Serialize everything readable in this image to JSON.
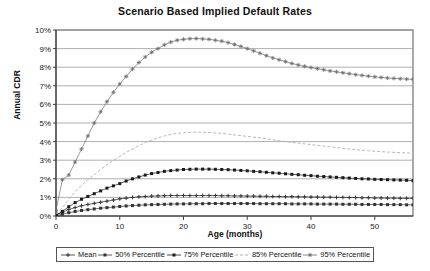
{
  "chart_data": {
    "type": "line",
    "title": "Scenario Based Implied Default Rates",
    "xlabel": "Age (months)",
    "ylabel": "Annual CDR",
    "xlim": [
      0,
      56
    ],
    "ylim": [
      0,
      10
    ],
    "grid": true,
    "legend_position": "bottom",
    "x_ticks": [
      0,
      10,
      20,
      30,
      40,
      50
    ],
    "x_tick_labels": [
      "0",
      "10",
      "20",
      "30",
      "40",
      "50"
    ],
    "y_ticks": [
      0,
      1,
      2,
      3,
      4,
      5,
      6,
      7,
      8,
      9,
      10
    ],
    "y_tick_labels": [
      "0%",
      "1%",
      "2%",
      "3%",
      "4%",
      "5%",
      "6%",
      "7%",
      "8%",
      "9%",
      "10%"
    ],
    "x": [
      0,
      1,
      2,
      3,
      4,
      5,
      6,
      7,
      8,
      9,
      10,
      11,
      12,
      13,
      14,
      15,
      16,
      17,
      18,
      19,
      20,
      21,
      22,
      23,
      24,
      25,
      26,
      27,
      28,
      29,
      30,
      31,
      32,
      33,
      34,
      35,
      36,
      37,
      38,
      39,
      40,
      41,
      42,
      43,
      44,
      45,
      46,
      47,
      48,
      49,
      50,
      51,
      52,
      53,
      54,
      55,
      56
    ],
    "series": [
      {
        "name": "Mean",
        "color": "#2b2b2b",
        "marker": "plus",
        "values": [
          0.05,
          0.2,
          0.35,
          0.45,
          0.55,
          0.62,
          0.68,
          0.74,
          0.8,
          0.86,
          0.92,
          0.96,
          1.0,
          1.03,
          1.05,
          1.07,
          1.08,
          1.09,
          1.1,
          1.1,
          1.1,
          1.1,
          1.1,
          1.1,
          1.1,
          1.1,
          1.09,
          1.09,
          1.08,
          1.08,
          1.07,
          1.07,
          1.06,
          1.06,
          1.05,
          1.05,
          1.04,
          1.04,
          1.03,
          1.03,
          1.02,
          1.02,
          1.01,
          1.01,
          1.0,
          1.0,
          0.99,
          0.99,
          0.98,
          0.98,
          0.97,
          0.97,
          0.96,
          0.96,
          0.95,
          0.95,
          0.95
        ]
      },
      {
        "name": "50% Percentile",
        "color": "#333333",
        "marker": "square",
        "values": [
          0.02,
          0.1,
          0.18,
          0.24,
          0.3,
          0.34,
          0.38,
          0.42,
          0.45,
          0.48,
          0.51,
          0.54,
          0.56,
          0.58,
          0.6,
          0.61,
          0.62,
          0.63,
          0.64,
          0.65,
          0.65,
          0.66,
          0.66,
          0.66,
          0.67,
          0.67,
          0.67,
          0.67,
          0.67,
          0.67,
          0.67,
          0.67,
          0.66,
          0.66,
          0.66,
          0.66,
          0.66,
          0.65,
          0.65,
          0.65,
          0.65,
          0.64,
          0.64,
          0.64,
          0.64,
          0.63,
          0.63,
          0.63,
          0.62,
          0.62,
          0.62,
          0.62,
          0.61,
          0.61,
          0.61,
          0.6,
          0.6
        ]
      },
      {
        "name": "75% Percentile",
        "color": "#1a1a1a",
        "marker": "dash-square",
        "values": [
          0.05,
          0.25,
          0.5,
          0.72,
          0.9,
          1.05,
          1.2,
          1.35,
          1.5,
          1.62,
          1.74,
          1.88,
          2.0,
          2.1,
          2.2,
          2.28,
          2.34,
          2.4,
          2.44,
          2.47,
          2.5,
          2.51,
          2.52,
          2.52,
          2.52,
          2.51,
          2.5,
          2.49,
          2.47,
          2.45,
          2.43,
          2.4,
          2.38,
          2.35,
          2.32,
          2.3,
          2.27,
          2.24,
          2.22,
          2.19,
          2.17,
          2.14,
          2.12,
          2.1,
          2.08,
          2.06,
          2.04,
          2.02,
          2.0,
          1.99,
          1.97,
          1.96,
          1.95,
          1.94,
          1.93,
          1.92,
          1.9
        ]
      },
      {
        "name": "85% Percentile",
        "color": "#b0b0b0",
        "marker": "none",
        "values": [
          0.1,
          0.45,
          0.9,
          1.3,
          1.65,
          1.95,
          2.22,
          2.5,
          2.75,
          3.0,
          3.2,
          3.42,
          3.6,
          3.78,
          3.95,
          4.08,
          4.2,
          4.3,
          4.38,
          4.44,
          4.48,
          4.5,
          4.51,
          4.5,
          4.49,
          4.47,
          4.44,
          4.4,
          4.36,
          4.32,
          4.28,
          4.24,
          4.2,
          4.15,
          4.1,
          4.05,
          4.0,
          3.96,
          3.92,
          3.88,
          3.84,
          3.8,
          3.76,
          3.72,
          3.68,
          3.64,
          3.6,
          3.57,
          3.54,
          3.51,
          3.48,
          3.46,
          3.44,
          3.42,
          3.4,
          3.39,
          3.38
        ]
      },
      {
        "name": "95% Percentile",
        "color": "#6e6e6e",
        "marker": "star",
        "values": [
          0.3,
          1.95,
          2.2,
          2.9,
          3.6,
          4.3,
          5.0,
          5.6,
          6.15,
          6.65,
          7.1,
          7.5,
          7.9,
          8.25,
          8.55,
          8.8,
          9.0,
          9.2,
          9.35,
          9.45,
          9.5,
          9.53,
          9.54,
          9.52,
          9.5,
          9.45,
          9.4,
          9.32,
          9.22,
          9.12,
          9.0,
          8.88,
          8.75,
          8.62,
          8.5,
          8.4,
          8.3,
          8.2,
          8.12,
          8.05,
          7.98,
          7.92,
          7.86,
          7.8,
          7.75,
          7.7,
          7.65,
          7.6,
          7.56,
          7.52,
          7.48,
          7.45,
          7.42,
          7.4,
          7.38,
          7.36,
          7.35
        ]
      }
    ]
  },
  "legend": {
    "items": [
      {
        "label": "Mean"
      },
      {
        "label": "50% Percentile"
      },
      {
        "label": "75% Percentile"
      },
      {
        "label": "85% Percentile"
      },
      {
        "label": "95% Percentile"
      }
    ]
  }
}
